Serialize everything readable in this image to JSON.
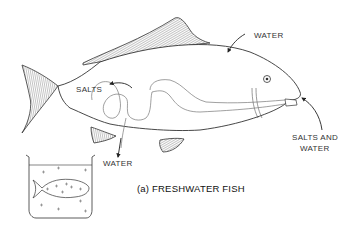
{
  "diagram": {
    "labels": {
      "water_in": "WATER",
      "salts_out": "SALTS",
      "water_out": "WATER",
      "salts_and_water_line1": "SALTS AND",
      "salts_and_water_line2": "WATER"
    },
    "caption": "(a) FRESHWATER FISH",
    "colors": {
      "line": "#333333",
      "fin_hatch": "#555555",
      "background": "#ffffff"
    }
  }
}
